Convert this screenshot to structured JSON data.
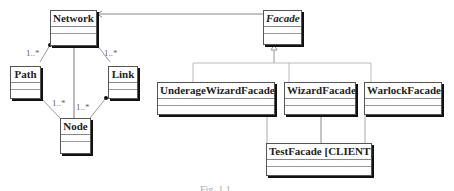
{
  "classes": {
    "network": "Network",
    "path": "Path",
    "link": "Link",
    "node": "Node",
    "facade": "Facade",
    "underage_wizard_facade": "UnderageWizardFacade",
    "wizard_facade": "WizardFacade",
    "warlock_facade": "WarlockFacade",
    "test_facade": "TestFacade [CLIENT]"
  },
  "multiplicities": {
    "network_path": "1..*",
    "network_link": "1..*",
    "path_node": "1..*",
    "link_node": "1..*"
  },
  "caption": "Fig. 1.1"
}
